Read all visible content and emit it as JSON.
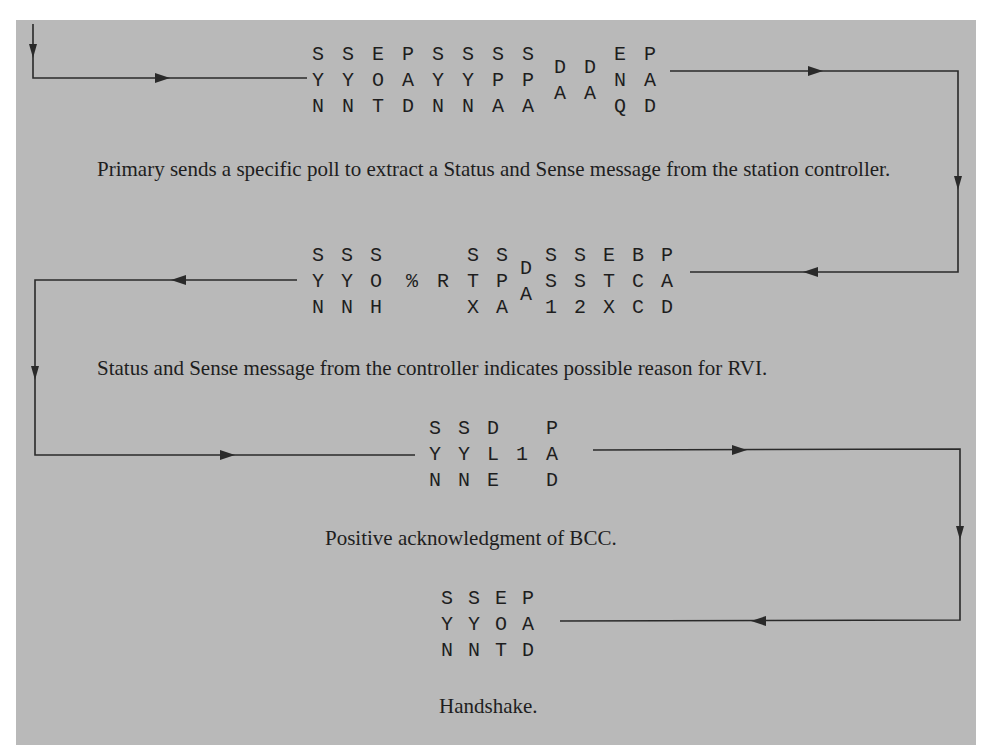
{
  "diagram": {
    "title": "",
    "frames": [
      {
        "id": "frame-1",
        "direction": "primary-to-controller",
        "columns": [
          [
            "S",
            "Y",
            "N"
          ],
          [
            "S",
            "Y",
            "N"
          ],
          [
            "E",
            "O",
            "T"
          ],
          [
            "P",
            "A",
            "D"
          ],
          [
            "S",
            "Y",
            "N"
          ],
          [
            "S",
            "Y",
            "N"
          ],
          [
            "S",
            "P",
            "A"
          ],
          [
            "S",
            "P",
            "A"
          ],
          [
            "D",
            "A"
          ],
          [
            "D",
            "A"
          ],
          [
            "E",
            "N",
            "Q"
          ],
          [
            "P",
            "A",
            "D"
          ]
        ],
        "caption": "Primary sends a specific poll to extract a Status and Sense message from the station controller."
      },
      {
        "id": "frame-2",
        "direction": "controller-to-primary",
        "columns": [
          [
            "S",
            "Y",
            "N"
          ],
          [
            "S",
            "Y",
            "N"
          ],
          [
            "S",
            "O",
            "H"
          ],
          [
            "",
            "%",
            ""
          ],
          [
            "",
            "R",
            ""
          ],
          [
            "S",
            "T",
            "X"
          ],
          [
            "S",
            "P",
            "A"
          ],
          [
            "D",
            "A"
          ],
          [
            "S",
            "S",
            "1"
          ],
          [
            "S",
            "S",
            "2"
          ],
          [
            "E",
            "T",
            "X"
          ],
          [
            "B",
            "C",
            "C"
          ],
          [
            "P",
            "A",
            "D"
          ]
        ],
        "caption": "Status and Sense message from the controller indicates possible reason for RVI."
      },
      {
        "id": "frame-3",
        "direction": "primary-to-controller",
        "columns": [
          [
            "S",
            "Y",
            "N"
          ],
          [
            "S",
            "Y",
            "N"
          ],
          [
            "D",
            "L",
            "E"
          ],
          [
            "",
            "1",
            ""
          ],
          [
            "P",
            "A",
            "D"
          ]
        ],
        "caption": "Positive acknowledgment of BCC."
      },
      {
        "id": "frame-4",
        "direction": "controller-to-primary",
        "columns": [
          [
            "S",
            "Y",
            "N"
          ],
          [
            "S",
            "Y",
            "N"
          ],
          [
            "E",
            "O",
            "T"
          ],
          [
            "P",
            "A",
            "D"
          ]
        ],
        "caption": "Handshake."
      }
    ],
    "colors": {
      "background": "#b9b9b9",
      "ink": "#1e1e1e",
      "line": "#2a2a2a"
    }
  }
}
